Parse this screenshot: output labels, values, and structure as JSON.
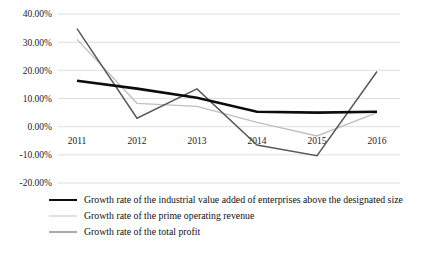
{
  "chart_data": {
    "type": "line",
    "title": "",
    "xlabel": "",
    "ylabel": "",
    "categories": [
      "2011",
      "2012",
      "2013",
      "2014",
      "2015",
      "2016"
    ],
    "ylim": [
      -20,
      40
    ],
    "yticks": [
      40,
      30,
      20,
      10,
      0,
      -10,
      -20
    ],
    "ytick_labels": [
      "40.00%",
      "30.00%",
      "20.00%",
      "10.00%",
      "0.00%",
      "-10.00%",
      "-20.00%"
    ],
    "grid": true,
    "legend_position": "bottom-left",
    "series": [
      {
        "name": "Growth rate of the industrial value added of enterprises above the designated size",
        "color": "#0d0d0d",
        "width": 2.6,
        "values": [
          16.3,
          13.5,
          10.3,
          5.3,
          5.0,
          5.3
        ]
      },
      {
        "name": "Growth rate of the prime operating revenue",
        "color": "#bfbfbf",
        "width": 1.3,
        "values": [
          31.0,
          8.3,
          7.2,
          1.5,
          -3.3,
          5.0
        ]
      },
      {
        "name": "Growth rate of the total profit",
        "color": "#595959",
        "width": 1.5,
        "values": [
          34.8,
          3.0,
          13.4,
          -6.5,
          -10.3,
          19.6
        ]
      }
    ]
  },
  "legend": {
    "items": [
      "Growth rate of the industrial value added of enterprises above the designated size",
      "Growth rate of the prime operating revenue",
      "Growth rate of the total profit"
    ]
  }
}
